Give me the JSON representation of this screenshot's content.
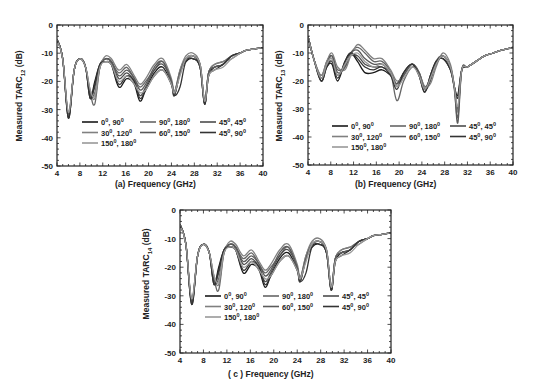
{
  "figure": {
    "panels": [
      {
        "id": "a",
        "xlabel": "(a) Frequency (GHz)",
        "ylabel_main": "Measured TARC",
        "ylabel_sub": "12",
        "ylabel_unit": " (dB)"
      },
      {
        "id": "b",
        "xlabel": "(b) Frequency (GHz)",
        "ylabel_main": "Measured TARC",
        "ylabel_sub": "13",
        "ylabel_unit": " (dB)"
      },
      {
        "id": "c",
        "xlabel": "( c ) Frequency (GHz)",
        "ylabel_main": "Measured TARC",
        "ylabel_sub": "14",
        "ylabel_unit": " (dB)"
      }
    ]
  },
  "chart_data": [
    {
      "type": "line",
      "title": "",
      "xlabel": "(a) Frequency (GHz)",
      "ylabel": "Measured TARC12 (dB)",
      "xlim": [
        4,
        40
      ],
      "ylim": [
        -50,
        0
      ],
      "xticks": [
        4,
        8,
        12,
        16,
        20,
        24,
        28,
        32,
        36,
        40
      ],
      "yticks": [
        0,
        -10,
        -20,
        -30,
        -40,
        -50
      ],
      "legend_position": "lower-center inside",
      "x": [
        4,
        5,
        6,
        7,
        8,
        9,
        9.8,
        10.6,
        11.5,
        12.5,
        13.5,
        14.8,
        16.2,
        17.5,
        18.5,
        19.5,
        21,
        22.5,
        24,
        24.5,
        25.5,
        26.5,
        27.8,
        29,
        29.8,
        30.5,
        31.5,
        33,
        34.5,
        36,
        37,
        38.5,
        40
      ],
      "series": [
        {
          "name": "0°, 90°",
          "color": "#1a1a1a",
          "values": [
            -5,
            -12,
            -33,
            -16,
            -12,
            -15,
            -26,
            -20,
            -14,
            -13,
            -14,
            -22,
            -19,
            -21,
            -27,
            -23,
            -17,
            -15,
            -21,
            -25,
            -17,
            -13,
            -12,
            -15,
            -28,
            -18,
            -15,
            -14,
            -11,
            -10,
            -9,
            -8.5,
            -8
          ]
        },
        {
          "name": "90°, 180°",
          "color": "#666666",
          "values": [
            -5,
            -12,
            -32,
            -16,
            -12,
            -15,
            -24,
            -28,
            -15,
            -12,
            -13,
            -17,
            -15,
            -19,
            -22,
            -20,
            -16,
            -13,
            -20,
            -24,
            -16,
            -12,
            -11,
            -14,
            -27,
            -17,
            -14,
            -13,
            -11,
            -10,
            -9,
            -8.5,
            -8
          ]
        },
        {
          "name": "45°, 45°",
          "color": "#4d4d4d",
          "values": [
            -5,
            -12,
            -32,
            -16,
            -12,
            -15,
            -25,
            -22,
            -14,
            -12,
            -13,
            -19,
            -17,
            -20,
            -25,
            -22,
            -16,
            -14,
            -20,
            -25,
            -17,
            -12,
            -11,
            -15,
            -28,
            -17,
            -15,
            -14,
            -11,
            -10,
            -9,
            -8.5,
            -8
          ]
        },
        {
          "name": "30°, 120°",
          "color": "#808080",
          "values": [
            -5,
            -12,
            -31,
            -16,
            -12,
            -15,
            -23,
            -26,
            -15,
            -11,
            -12,
            -16,
            -14,
            -18,
            -21,
            -19,
            -14,
            -12,
            -19,
            -24,
            -16,
            -11,
            -10,
            -14,
            -27,
            -17,
            -14,
            -13,
            -12,
            -10,
            -9,
            -8.5,
            -8
          ]
        },
        {
          "name": "60°, 150°",
          "color": "#5a5a5a",
          "values": [
            -5,
            -12,
            -32,
            -16,
            -12,
            -15,
            -25,
            -24,
            -15,
            -12,
            -13,
            -18,
            -16,
            -19,
            -23,
            -21,
            -15,
            -13,
            -20,
            -24,
            -17,
            -12,
            -11,
            -14,
            -27,
            -17,
            -15,
            -14,
            -11,
            -10,
            -9,
            -8.5,
            -8
          ]
        },
        {
          "name": "45°, 90°",
          "color": "#333333",
          "values": [
            -5,
            -12,
            -33,
            -16,
            -12,
            -15,
            -26,
            -21,
            -14,
            -13,
            -14,
            -21,
            -18,
            -20,
            -26,
            -23,
            -18,
            -16,
            -21,
            -25,
            -22,
            -13,
            -12,
            -15,
            -28,
            -18,
            -16,
            -14,
            -11,
            -10,
            -9,
            -8.5,
            -8
          ]
        },
        {
          "name": "150°, 180°",
          "color": "#999999",
          "values": [
            -5,
            -12,
            -31,
            -16,
            -12,
            -15,
            -23,
            -25,
            -15,
            -13,
            -14,
            -20,
            -18,
            -21,
            -24,
            -23,
            -18,
            -16,
            -21,
            -24,
            -18,
            -12,
            -11,
            -14,
            -27,
            -18,
            -16,
            -15,
            -12,
            -10,
            -9,
            -8.5,
            -8
          ]
        }
      ]
    },
    {
      "type": "line",
      "title": "",
      "xlabel": "(b) Frequency (GHz)",
      "ylabel": "Measured TARC13 (dB)",
      "xlim": [
        4,
        40
      ],
      "ylim": [
        -50,
        0
      ],
      "xticks": [
        4,
        8,
        12,
        16,
        20,
        24,
        28,
        32,
        36,
        40
      ],
      "yticks": [
        0,
        -10,
        -20,
        -30,
        -40,
        -50
      ],
      "legend_position": "lower-center inside",
      "x": [
        4,
        5,
        6.3,
        7.3,
        8.2,
        9.2,
        10.5,
        11.5,
        12.7,
        14,
        15.5,
        17,
        18.5,
        19.6,
        20.8,
        22.3,
        23.5,
        24.5,
        25.5,
        26.5,
        27.7,
        29,
        29.7,
        30.3,
        31,
        32,
        33.5,
        35,
        36.5,
        38,
        40
      ],
      "series": [
        {
          "name": "0°, 90°",
          "color": "#1a1a1a",
          "values": [
            -4,
            -12,
            -20,
            -15,
            -14,
            -20,
            -13,
            -10,
            -13,
            -17,
            -17,
            -16,
            -18,
            -21,
            -17,
            -14,
            -18,
            -24,
            -18,
            -13,
            -12,
            -16,
            -22,
            -25,
            -16,
            -15,
            -13,
            -11,
            -10,
            -9,
            -8
          ]
        },
        {
          "name": "90°, 180°",
          "color": "#666666",
          "values": [
            -4,
            -12,
            -18,
            -13,
            -11,
            -16,
            -15,
            -10,
            -8,
            -10,
            -13,
            -13,
            -17,
            -27,
            -20,
            -15,
            -17,
            -22,
            -19,
            -14,
            -11,
            -15,
            -23,
            -33,
            -16,
            -15,
            -13,
            -11,
            -10,
            -9,
            -8
          ]
        },
        {
          "name": "45°, 90°",
          "color": "#4d4d4d",
          "values": [
            -4,
            -12,
            -19,
            -14,
            -12,
            -18,
            -14,
            -11,
            -11,
            -14,
            -15,
            -15,
            -17,
            -22,
            -18,
            -14,
            -17,
            -23,
            -20,
            -13,
            -11,
            -15,
            -22,
            -30,
            -16,
            -15,
            -13,
            -11,
            -10,
            -9,
            -8
          ]
        },
        {
          "name": "30°, 120°",
          "color": "#808080",
          "values": [
            -4,
            -12,
            -18,
            -13,
            -10,
            -15,
            -16,
            -11,
            -7,
            -9,
            -12,
            -12,
            -16,
            -20,
            -18,
            -14,
            -17,
            -22,
            -21,
            -15,
            -10,
            -14,
            -22,
            -31,
            -16,
            -15,
            -13,
            -11,
            -10,
            -9,
            -8
          ]
        },
        {
          "name": "60°, 150°",
          "color": "#5a5a5a",
          "values": [
            -4,
            -12,
            -19,
            -14,
            -11,
            -17,
            -15,
            -10,
            -9,
            -12,
            -14,
            -14,
            -17,
            -21,
            -18,
            -14,
            -17,
            -23,
            -19,
            -14,
            -11,
            -15,
            -22,
            -35,
            -16,
            -15,
            -13,
            -11,
            -10,
            -9,
            -8
          ]
        },
        {
          "name": "45°, 45°",
          "color": "#333333",
          "values": [
            -4,
            -12,
            -20,
            -15,
            -13,
            -19,
            -13,
            -10,
            -12,
            -15,
            -16,
            -15,
            -18,
            -23,
            -17,
            -14,
            -18,
            -24,
            -18,
            -13,
            -12,
            -16,
            -22,
            -26,
            -16,
            -15,
            -13,
            -11,
            -10,
            -9,
            -8
          ]
        },
        {
          "name": "150°, 180°",
          "color": "#999999",
          "values": [
            -4,
            -12,
            -19,
            -14,
            -12,
            -18,
            -14,
            -11,
            -10,
            -13,
            -15,
            -14,
            -17,
            -22,
            -19,
            -15,
            -18,
            -23,
            -19,
            -14,
            -11,
            -15,
            -22,
            -29,
            -16,
            -15,
            -13,
            -11,
            -10,
            -9,
            -8
          ]
        }
      ]
    },
    {
      "type": "line",
      "title": "",
      "xlabel": "( c ) Frequency (GHz)",
      "ylabel": "Measured TARC14 (dB)",
      "xlim": [
        4,
        40
      ],
      "ylim": [
        -50,
        0
      ],
      "xticks": [
        4,
        8,
        12,
        16,
        20,
        24,
        28,
        32,
        36,
        40
      ],
      "yticks": [
        0,
        -10,
        -20,
        -30,
        -40,
        -50
      ],
      "legend_position": "lower-center inside",
      "x": [
        4,
        5,
        6,
        7,
        8,
        9,
        9.8,
        10.6,
        11.5,
        12.5,
        13.5,
        14.8,
        16.2,
        17.5,
        18.5,
        19.5,
        21,
        22.5,
        24,
        24.5,
        25.5,
        26.5,
        27.8,
        29,
        29.8,
        30.5,
        31.5,
        33,
        34.5,
        36,
        37,
        38.5,
        40
      ],
      "series": [
        {
          "name": "0°, 90°",
          "color": "#1a1a1a",
          "values": [
            -5,
            -12,
            -33,
            -16,
            -12,
            -15,
            -26,
            -20,
            -14,
            -13,
            -14,
            -22,
            -19,
            -21,
            -27,
            -23,
            -17,
            -15,
            -21,
            -25,
            -17,
            -13,
            -12,
            -15,
            -28,
            -18,
            -15,
            -14,
            -11,
            -10,
            -9,
            -8.5,
            -8
          ]
        },
        {
          "name": "90°, 180°",
          "color": "#666666",
          "values": [
            -5,
            -12,
            -32,
            -16,
            -12,
            -15,
            -24,
            -28,
            -15,
            -12,
            -13,
            -17,
            -15,
            -19,
            -22,
            -20,
            -16,
            -13,
            -20,
            -24,
            -16,
            -12,
            -11,
            -14,
            -27,
            -17,
            -14,
            -13,
            -11,
            -10,
            -9,
            -8.5,
            -8
          ]
        },
        {
          "name": "45°, 45°",
          "color": "#4d4d4d",
          "values": [
            -5,
            -12,
            -32,
            -16,
            -12,
            -15,
            -25,
            -22,
            -14,
            -12,
            -13,
            -19,
            -17,
            -20,
            -25,
            -22,
            -16,
            -14,
            -20,
            -25,
            -17,
            -12,
            -11,
            -15,
            -28,
            -17,
            -15,
            -14,
            -11,
            -10,
            -9,
            -8.5,
            -8
          ]
        },
        {
          "name": "30°, 120°",
          "color": "#808080",
          "values": [
            -5,
            -12,
            -31,
            -16,
            -12,
            -15,
            -23,
            -26,
            -15,
            -11,
            -12,
            -16,
            -14,
            -18,
            -21,
            -19,
            -14,
            -12,
            -19,
            -24,
            -16,
            -11,
            -10,
            -14,
            -27,
            -17,
            -14,
            -13,
            -12,
            -10,
            -9,
            -8.5,
            -8
          ]
        },
        {
          "name": "60°, 150°",
          "color": "#5a5a5a",
          "values": [
            -5,
            -12,
            -32,
            -16,
            -12,
            -15,
            -25,
            -24,
            -15,
            -12,
            -13,
            -18,
            -16,
            -19,
            -23,
            -21,
            -15,
            -13,
            -20,
            -24,
            -17,
            -12,
            -11,
            -14,
            -27,
            -17,
            -15,
            -14,
            -11,
            -10,
            -9,
            -8.5,
            -8
          ]
        },
        {
          "name": "45°, 90°",
          "color": "#333333",
          "values": [
            -5,
            -12,
            -33,
            -16,
            -12,
            -15,
            -26,
            -21,
            -14,
            -13,
            -14,
            -21,
            -18,
            -20,
            -26,
            -23,
            -18,
            -16,
            -21,
            -25,
            -22,
            -13,
            -12,
            -15,
            -28,
            -18,
            -16,
            -14,
            -11,
            -10,
            -9,
            -8.5,
            -8
          ]
        },
        {
          "name": "150°, 180°",
          "color": "#999999",
          "values": [
            -5,
            -12,
            -31,
            -16,
            -12,
            -15,
            -23,
            -25,
            -15,
            -13,
            -14,
            -20,
            -18,
            -21,
            -24,
            -23,
            -18,
            -16,
            -21,
            -24,
            -18,
            -12,
            -11,
            -14,
            -27,
            -18,
            -16,
            -15,
            -12,
            -10,
            -9,
            -8.5,
            -8
          ]
        }
      ]
    }
  ],
  "legends": [
    {
      "rows": [
        [
          {
            "label": "0",
            "sup1": "0",
            "mid": ", 90",
            "sup2": "0"
          },
          {
            "label": "90",
            "sup1": "0",
            "mid": ", 180",
            "sup2": "0"
          },
          {
            "label": "45",
            "sup1": "0",
            "mid": ", 45",
            "sup2": "0"
          }
        ],
        [
          {
            "label": "30",
            "sup1": "0",
            "mid": ", 120",
            "sup2": "0"
          },
          {
            "label": "60",
            "sup1": "0",
            "mid": ", 150",
            "sup2": "0"
          },
          {
            "label": "45",
            "sup1": "0",
            "mid": ", 90",
            "sup2": "0"
          }
        ],
        [
          {
            "label": "150",
            "sup1": "0",
            "mid": ", 180",
            "sup2": "0"
          }
        ]
      ]
    }
  ]
}
